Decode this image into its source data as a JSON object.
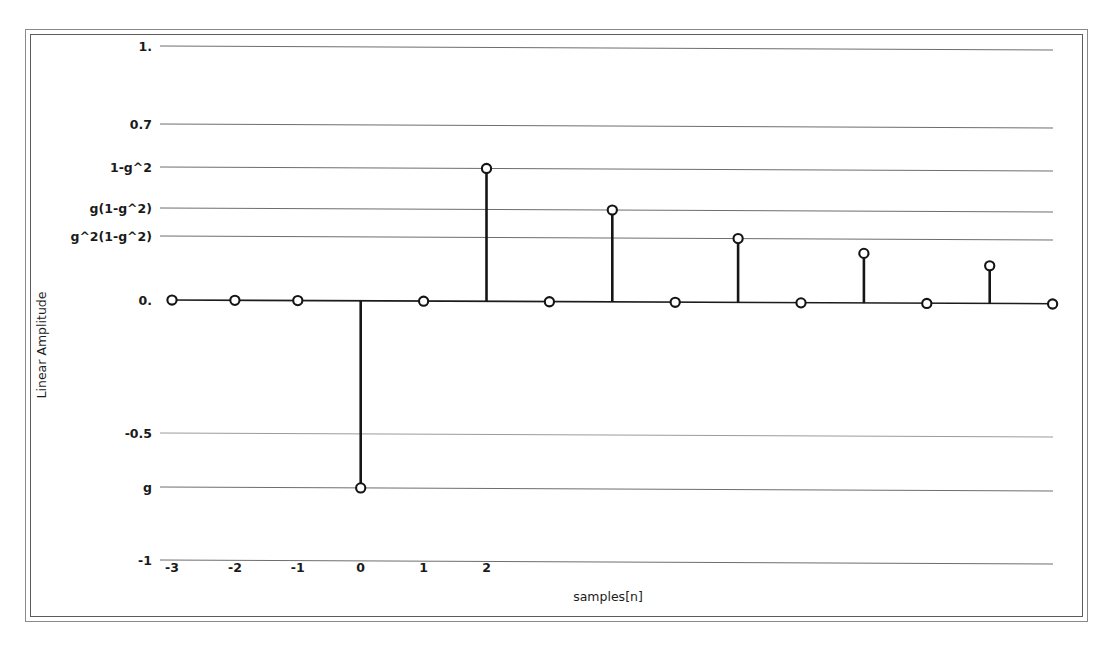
{
  "figure": {
    "background_color": "#ffffff",
    "frame_color": "#5c5c5c",
    "line_color": "#161616"
  },
  "chart_data": {
    "type": "scatter",
    "title": "",
    "subtitle": "",
    "xlabel": "samples[n]",
    "ylabel": "Linear Amplitude",
    "grid": true,
    "legend": null,
    "xlim": [
      -3,
      11
    ],
    "ylim": [
      -1,
      1
    ],
    "x_tick_labels": [
      "-3",
      "-2",
      "-1",
      "0",
      "1",
      "2"
    ],
    "x_tick_values": [
      -3,
      -2,
      -1,
      0,
      1,
      2
    ],
    "y_tick_labels": [
      "1.",
      "0.7",
      "1-g^2",
      "g(1-g^2)",
      "g^2(1-g^2)",
      "0.",
      "-0.5",
      "g",
      "-1"
    ],
    "y_tick_values": [
      1.0,
      0.7,
      0.5,
      0.36,
      0.27,
      0.0,
      -0.5,
      -0.72,
      -1.0
    ],
    "marker": "open-circle",
    "stem_plot": true,
    "x": [
      -3,
      -2,
      -1,
      0,
      1,
      2,
      3,
      4,
      5,
      6,
      7,
      8,
      9,
      10,
      11
    ],
    "values": [
      0,
      0,
      0,
      -0.72,
      0,
      0.5,
      0,
      0.36,
      0,
      0.27,
      0,
      0.21,
      0,
      0.16,
      0
    ],
    "point_labels": [
      "0",
      "0",
      "0",
      "g",
      "0",
      "1-g^2",
      "0",
      "g(1-g^2)",
      "0",
      "g^2(1-g^2)",
      "0",
      "g^3(1-g^2)",
      "0",
      "g^4(1-g^2)",
      "0"
    ]
  }
}
